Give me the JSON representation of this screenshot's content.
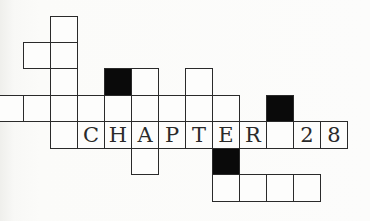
{
  "title_word": "CHAPTER",
  "chapter_number": "28",
  "colors": {
    "ink": "#2a2a2a",
    "black_cell": "#0a0a0a",
    "paper": "#fbfbf9"
  },
  "grid": {
    "cell_w": 27,
    "origin_x": 23,
    "row_tops": [
      16,
      42,
      68,
      95,
      121,
      148,
      174,
      201
    ],
    "cells": [
      {
        "r": 0,
        "c": 1,
        "type": "white",
        "text": ""
      },
      {
        "r": 1,
        "c": 0,
        "type": "white",
        "text": ""
      },
      {
        "r": 1,
        "c": 1,
        "type": "white",
        "text": ""
      },
      {
        "r": 2,
        "c": 1,
        "type": "white",
        "text": ""
      },
      {
        "r": 2,
        "c": 3,
        "type": "black",
        "text": ""
      },
      {
        "r": 2,
        "c": 4,
        "type": "white",
        "text": ""
      },
      {
        "r": 2,
        "c": 6,
        "type": "white",
        "text": ""
      },
      {
        "r": 3,
        "c": -1,
        "type": "partial",
        "text": ""
      },
      {
        "r": 3,
        "c": 0,
        "type": "white",
        "text": ""
      },
      {
        "r": 3,
        "c": 1,
        "type": "white",
        "text": ""
      },
      {
        "r": 3,
        "c": 2,
        "type": "white",
        "text": ""
      },
      {
        "r": 3,
        "c": 3,
        "type": "white",
        "text": ""
      },
      {
        "r": 3,
        "c": 4,
        "type": "white",
        "text": ""
      },
      {
        "r": 3,
        "c": 5,
        "type": "white",
        "text": ""
      },
      {
        "r": 3,
        "c": 6,
        "type": "white",
        "text": ""
      },
      {
        "r": 3,
        "c": 7,
        "type": "white",
        "text": ""
      },
      {
        "r": 3,
        "c": 9,
        "type": "black",
        "text": ""
      },
      {
        "r": 4,
        "c": 1,
        "type": "white",
        "text": ""
      },
      {
        "r": 4,
        "c": 2,
        "type": "white",
        "text": "C"
      },
      {
        "r": 4,
        "c": 3,
        "type": "white",
        "text": "H"
      },
      {
        "r": 4,
        "c": 4,
        "type": "white",
        "text": "A"
      },
      {
        "r": 4,
        "c": 5,
        "type": "white",
        "text": "P"
      },
      {
        "r": 4,
        "c": 6,
        "type": "white",
        "text": "T"
      },
      {
        "r": 4,
        "c": 7,
        "type": "white",
        "text": "E"
      },
      {
        "r": 4,
        "c": 8,
        "type": "white",
        "text": "R"
      },
      {
        "r": 4,
        "c": 9,
        "type": "white",
        "text": ""
      },
      {
        "r": 4,
        "c": 10,
        "type": "white",
        "text": "2"
      },
      {
        "r": 4,
        "c": 11,
        "type": "white",
        "text": "8"
      },
      {
        "r": 5,
        "c": 4,
        "type": "white",
        "text": ""
      },
      {
        "r": 5,
        "c": 7,
        "type": "black",
        "text": ""
      },
      {
        "r": 6,
        "c": 7,
        "type": "white",
        "text": ""
      },
      {
        "r": 6,
        "c": 8,
        "type": "white",
        "text": ""
      },
      {
        "r": 6,
        "c": 9,
        "type": "white",
        "text": ""
      },
      {
        "r": 6,
        "c": 10,
        "type": "white",
        "text": ""
      }
    ]
  }
}
